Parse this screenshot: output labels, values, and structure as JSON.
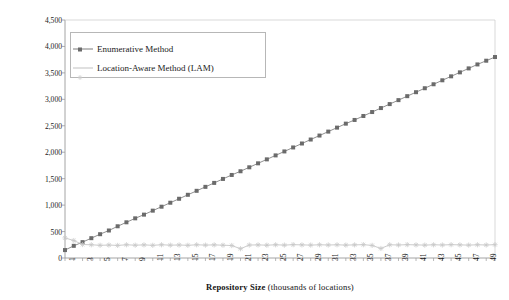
{
  "chart_data": {
    "type": "line",
    "title": "",
    "xlabel_bold": "Repository Size",
    "xlabel_rest": " (thousands of locations)",
    "ylabel": "Resultset Completion Time (milliseconds)",
    "xlim": [
      1,
      50
    ],
    "ylim": [
      0,
      4500
    ],
    "ytick_step": 500,
    "grid": false,
    "legend_position": "upper-left-inside",
    "yticks": [
      "0",
      "500",
      "1,000",
      "1,500",
      "2,000",
      "2,500",
      "3,000",
      "3,500",
      "4,000",
      "4,500"
    ],
    "ytick_values": [
      0,
      500,
      1000,
      1500,
      2000,
      2500,
      3000,
      3500,
      4000,
      4500
    ],
    "xticks": [
      "1",
      "3",
      "5",
      "7",
      "9",
      "11",
      "13",
      "15",
      "17",
      "19",
      "21",
      "23",
      "25",
      "27",
      "29",
      "31",
      "33",
      "35",
      "37",
      "39",
      "41",
      "43",
      "45",
      "47",
      "49"
    ],
    "xtick_values": [
      1,
      3,
      5,
      7,
      9,
      11,
      13,
      15,
      17,
      19,
      21,
      23,
      25,
      27,
      29,
      31,
      33,
      35,
      37,
      39,
      41,
      43,
      45,
      47,
      49
    ],
    "x": [
      1,
      2,
      3,
      4,
      5,
      6,
      7,
      8,
      9,
      10,
      11,
      12,
      13,
      14,
      15,
      16,
      17,
      18,
      19,
      20,
      21,
      22,
      23,
      24,
      25,
      26,
      27,
      28,
      29,
      30,
      31,
      32,
      33,
      34,
      35,
      36,
      37,
      38,
      39,
      40,
      41,
      42,
      43,
      44,
      45,
      46,
      47,
      48,
      49,
      50
    ],
    "series": [
      {
        "name": "Enumerative Method",
        "color": "#7c7c7c",
        "marker": "square",
        "marker_color": "#6b6b6b",
        "values": [
          150,
          230,
          300,
          375,
          450,
          520,
          600,
          675,
          750,
          820,
          895,
          970,
          1045,
          1120,
          1195,
          1270,
          1345,
          1420,
          1495,
          1570,
          1640,
          1715,
          1790,
          1865,
          1940,
          2015,
          2090,
          2165,
          2240,
          2315,
          2390,
          2465,
          2540,
          2610,
          2685,
          2760,
          2835,
          2910,
          2985,
          3060,
          3135,
          3210,
          3285,
          3360,
          3435,
          3510,
          3585,
          3660,
          3730,
          3800
        ]
      },
      {
        "name": "Location-Aware Method (LAM)",
        "color": "#c2c2c2",
        "marker": "star",
        "marker_color": "#c8c8c8",
        "values": [
          380,
          330,
          255,
          250,
          240,
          245,
          238,
          250,
          242,
          248,
          240,
          250,
          243,
          246,
          240,
          250,
          244,
          248,
          242,
          236,
          175,
          245,
          248,
          242,
          250,
          244,
          252,
          248,
          244,
          250,
          246,
          250,
          244,
          248,
          252,
          238,
          180,
          250,
          246,
          252,
          248,
          244,
          250,
          246,
          252,
          248,
          244,
          250,
          246,
          252
        ]
      }
    ]
  },
  "legend": {
    "items": [
      {
        "label": "Enumerative Method"
      },
      {
        "label": "Location-Aware Method (LAM)"
      }
    ]
  }
}
